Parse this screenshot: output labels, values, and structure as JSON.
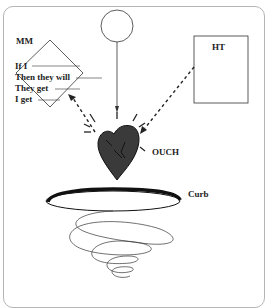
{
  "labels": {
    "mm": "MM",
    "ht": "HT",
    "ouch": "OUCH",
    "curb": "Curb"
  },
  "mm_lines": [
    "If I",
    "Then they will",
    "They get",
    "I get"
  ],
  "colors": {
    "heart_fill": "#3a3a3a",
    "stroke": "#222222",
    "frame": "#b5b5b5"
  }
}
